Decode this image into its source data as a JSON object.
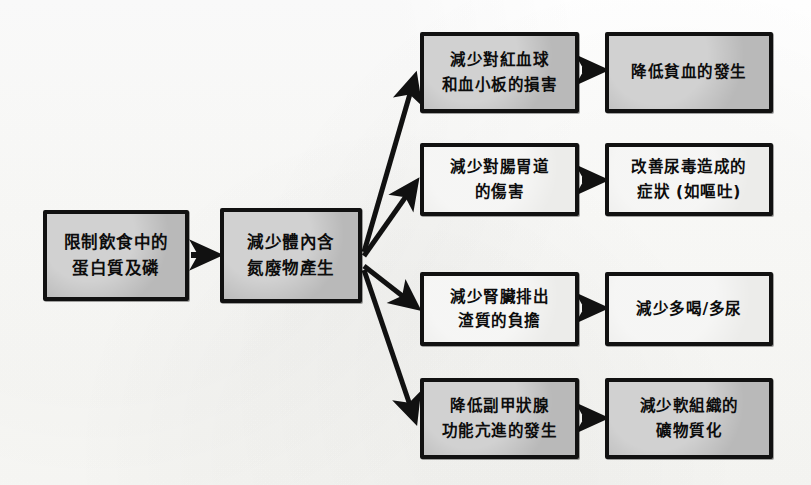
{
  "diagram": {
    "type": "flowchart",
    "title": "",
    "language": "zh-Hant",
    "style": "hand-drawn photocopy",
    "background_color": "#fdfdfb",
    "box_border_color": "#111111",
    "box_fill_grey": "#b9b9b9",
    "box_fill_light": "#ececea",
    "arrow_color": "#111111"
  },
  "nodes": {
    "start": {
      "line1": "限制飲食中的",
      "line2": "蛋白質及磷"
    },
    "second": {
      "line1": "減少體內含",
      "line2": "氮廢物產生"
    },
    "branch1": {
      "line1": "減少對紅血球",
      "line2": "和血小板的損害"
    },
    "branch2": {
      "line1": "減少對腸胃道",
      "line2": "的傷害"
    },
    "branch3": {
      "line1": "減少腎臟排出",
      "line2": "渣質的負擔"
    },
    "branch4": {
      "line1": "降低副甲狀腺",
      "line2": "功能亢進的發生"
    },
    "outcome1": {
      "line1": "降低貧血的發生"
    },
    "outcome2": {
      "line1": "改善尿毒造成的",
      "line2": "症狀 (如嘔吐)"
    },
    "outcome3": {
      "line1": "減少多喝/多尿"
    },
    "outcome4": {
      "line1": "減少軟組織的",
      "line2": "礦物質化"
    }
  },
  "connectors": {
    "start_to_second": "arrow-right-icon",
    "second_to_branch1": "arrow-diagonal-up-icon",
    "second_to_branch2": "arrow-diagonal-up-icon",
    "second_to_branch3": "arrow-diagonal-down-icon",
    "second_to_branch4": "arrow-diagonal-down-icon",
    "branch1_to_outcome1": "arrow-right-icon",
    "branch2_to_outcome2": "arrow-right-icon",
    "branch3_to_outcome3": "arrow-right-icon",
    "branch4_to_outcome4": "arrow-right-icon"
  }
}
